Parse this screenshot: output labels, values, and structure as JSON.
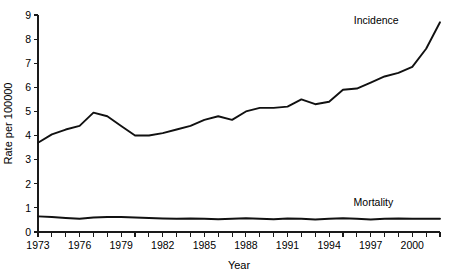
{
  "chart_data": {
    "type": "line",
    "title": "",
    "subtitle": "",
    "xlabel": "Year",
    "ylabel": "Rate per 100000",
    "xlim": [
      1973,
      2002
    ],
    "ylim": [
      0,
      9
    ],
    "x_ticks_major": [
      1973,
      1976,
      1979,
      1982,
      1985,
      1988,
      1991,
      1994,
      1997,
      2000
    ],
    "x_tick_labels": [
      "1973",
      "1976",
      "1979",
      "1982",
      "1985",
      "1988",
      "1991",
      "1994",
      "1997",
      "2000"
    ],
    "x_ticks_all": [
      1973,
      1974,
      1975,
      1976,
      1977,
      1978,
      1979,
      1980,
      1981,
      1982,
      1983,
      1984,
      1985,
      1986,
      1987,
      1988,
      1989,
      1990,
      1991,
      1992,
      1993,
      1994,
      1995,
      1996,
      1997,
      1998,
      1999,
      2000,
      2001,
      2002
    ],
    "y_ticks": [
      0,
      1,
      2,
      3,
      4,
      5,
      6,
      7,
      8,
      9
    ],
    "y_tick_labels": [
      "0",
      "1",
      "2",
      "3",
      "4",
      "5",
      "6",
      "7",
      "8",
      "9"
    ],
    "grid": false,
    "legend_position": "inline-annotation",
    "line_color": "#111111",
    "x": [
      1973,
      1974,
      1975,
      1976,
      1977,
      1978,
      1979,
      1980,
      1981,
      1982,
      1983,
      1984,
      1985,
      1986,
      1987,
      1988,
      1989,
      1990,
      1991,
      1992,
      1993,
      1994,
      1995,
      1996,
      1997,
      1998,
      1999,
      2000,
      2001,
      2002
    ],
    "series": [
      {
        "name": "Incidence",
        "label_x": 1997.4,
        "label_y": 8.62,
        "values": [
          3.7,
          4.05,
          4.25,
          4.4,
          4.95,
          4.8,
          4.4,
          4.0,
          4.0,
          4.1,
          4.25,
          4.4,
          4.65,
          4.8,
          4.65,
          5.0,
          5.15,
          5.15,
          5.2,
          5.5,
          5.3,
          5.4,
          5.9,
          5.95,
          6.2,
          6.45,
          6.6,
          6.85,
          7.6,
          8.7
        ]
      },
      {
        "name": "Mortality",
        "label_x": 1997.2,
        "label_y": 1.08,
        "values": [
          0.65,
          0.62,
          0.58,
          0.55,
          0.6,
          0.62,
          0.62,
          0.6,
          0.58,
          0.56,
          0.55,
          0.56,
          0.55,
          0.53,
          0.55,
          0.57,
          0.55,
          0.53,
          0.56,
          0.55,
          0.52,
          0.55,
          0.57,
          0.55,
          0.52,
          0.55,
          0.56,
          0.55,
          0.55,
          0.55
        ]
      }
    ]
  },
  "layout": {
    "plot_left": 38,
    "plot_right": 440,
    "plot_top": 15,
    "plot_bottom": 232
  }
}
